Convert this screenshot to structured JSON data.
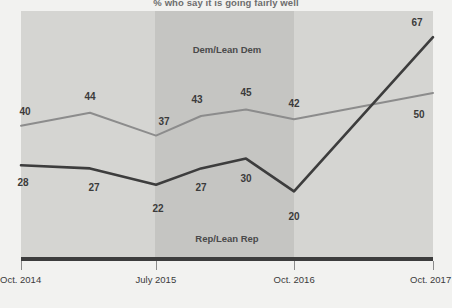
{
  "subtitle": "% who say it is going fairly well",
  "chart_data": {
    "type": "line",
    "title": "",
    "subtitle": "% who say it is going fairly well",
    "xlabel": "",
    "ylabel": "",
    "ylim": [
      0,
      75
    ],
    "grid": false,
    "legend_position": "inline-annotation",
    "x": [
      "Oct. 2014",
      "",
      "July 2015",
      "",
      "",
      "Oct. 2016",
      "Oct. 2017"
    ],
    "tick_labels": [
      "Oct. 2014",
      "July 2015",
      "Oct. 2016",
      "Oct. 2017"
    ],
    "series": [
      {
        "name": "Dem/Lean Dem",
        "color": "#8c8c8c",
        "values": [
          40,
          44,
          37,
          43,
          45,
          42,
          50
        ]
      },
      {
        "name": "Rep/Lean Rep",
        "color": "#3d3d3d",
        "values": [
          28,
          27,
          22,
          27,
          30,
          20,
          67
        ]
      }
    ],
    "bands": [
      {
        "name": "left-band",
        "color": "#d5d5d2"
      },
      {
        "name": "dem-band",
        "color": "#c5c5c2"
      },
      {
        "name": "right-band",
        "color": "#d5d5d2"
      }
    ]
  },
  "annotations": {
    "dem_label": "Dem/Lean Dem",
    "rep_label": "Rep/Lean Rep"
  },
  "axis": {
    "ticks": [
      {
        "label": "Oct. 2014"
      },
      {
        "label": "July 2015"
      },
      {
        "label": "Oct. 2016"
      },
      {
        "label": "Oct. 2017"
      }
    ]
  },
  "data_labels": {
    "dem": [
      "40",
      "44",
      "37",
      "43",
      "45",
      "42",
      "50"
    ],
    "rep": [
      "28",
      "27",
      "22",
      "27",
      "30",
      "20",
      "67"
    ]
  }
}
